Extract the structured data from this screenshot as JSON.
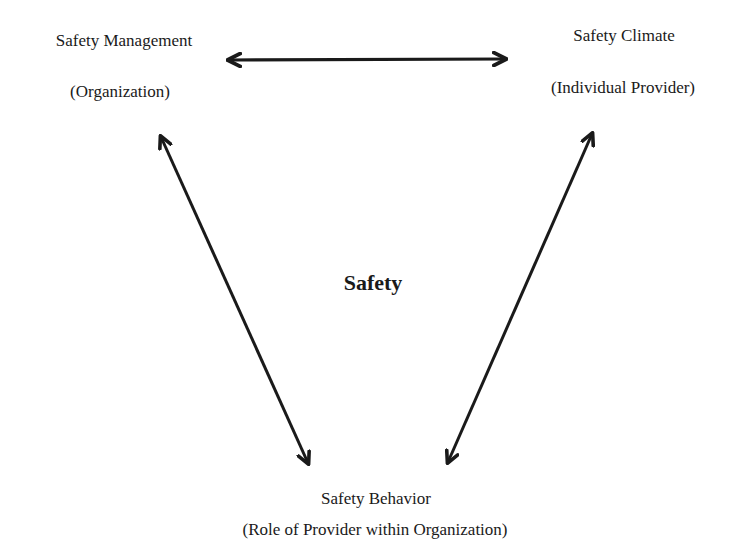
{
  "diagram": {
    "center_label": "Safety",
    "nodes": [
      {
        "id": "management",
        "title": "Safety Management",
        "subtitle": "(Organization)"
      },
      {
        "id": "climate",
        "title": "Safety Climate",
        "subtitle": "(Individual Provider)"
      },
      {
        "id": "behavior",
        "title": "Safety Behavior",
        "subtitle": "(Role of Provider within Organization)"
      }
    ],
    "edges": [
      {
        "from": "management",
        "to": "climate",
        "type": "bidirectional"
      },
      {
        "from": "management",
        "to": "behavior",
        "type": "bidirectional"
      },
      {
        "from": "climate",
        "to": "behavior",
        "type": "bidirectional"
      }
    ],
    "colors": {
      "text": "#1a1a1a",
      "arrow": "#1a1a1a",
      "background": "#ffffff"
    }
  }
}
